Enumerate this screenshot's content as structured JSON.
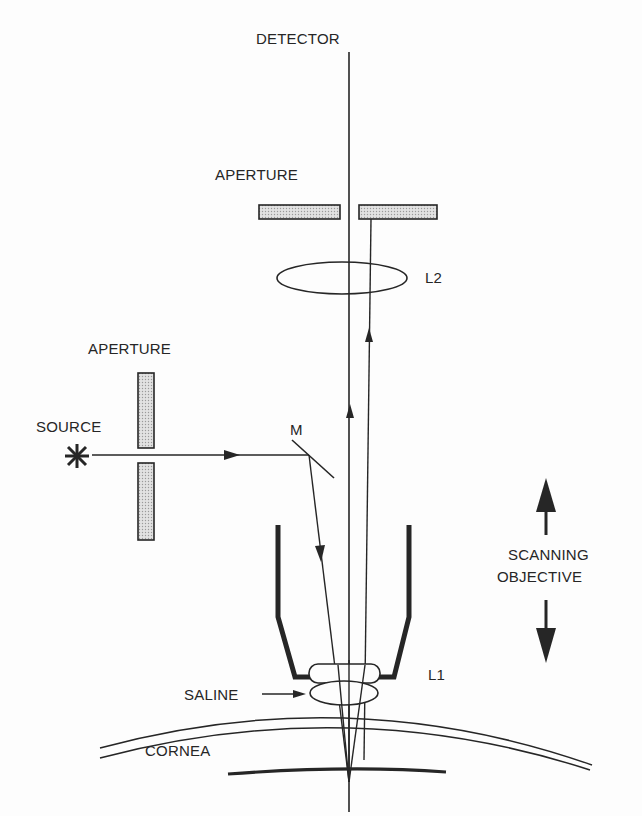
{
  "diagram": {
    "type": "optical-schematic",
    "labels": {
      "detector": "DETECTOR",
      "aperture_top": "APERTURE",
      "lens_l2": "L2",
      "aperture_left": "APERTURE",
      "source": "SOURCE",
      "mirror": "M",
      "scanning_line1": "SCANNING",
      "scanning_line2": "OBJECTIVE",
      "lens_l1": "L1",
      "saline": "SALINE",
      "cornea": "CORNEA"
    },
    "components": [
      {
        "name": "detector",
        "label": "DETECTOR"
      },
      {
        "name": "aperture-top",
        "label": "APERTURE",
        "kind": "pinhole-pair-horizontal"
      },
      {
        "name": "lens-l2",
        "label": "L2",
        "kind": "ellipse-lens"
      },
      {
        "name": "aperture-left",
        "label": "APERTURE",
        "kind": "pinhole-pair-vertical"
      },
      {
        "name": "source",
        "label": "SOURCE",
        "kind": "star"
      },
      {
        "name": "mirror",
        "label": "M",
        "kind": "beam-splitter"
      },
      {
        "name": "objective",
        "label": "L1",
        "kind": "objective-housing"
      },
      {
        "name": "saline",
        "label": "SALINE",
        "kind": "immersion-drop"
      },
      {
        "name": "cornea",
        "label": "CORNEA",
        "kind": "curved-layer"
      }
    ],
    "colors": {
      "ink": "#262626",
      "aperture_fill": "#cfcfcf",
      "background": "#fdfdfd"
    }
  }
}
